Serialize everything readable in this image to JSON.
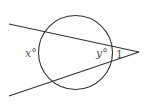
{
  "diagram": {
    "type": "geometry",
    "colors": {
      "stroke": "#333333",
      "label": "#555555",
      "background": "#ffffff"
    },
    "circle": {
      "cx": 75.5,
      "cy": 52.5,
      "r": 37
    },
    "vertex": {
      "x": 139,
      "y": 52
    },
    "lines": [
      {
        "name": "upper-secant",
        "x1": 9,
        "y1": 24,
        "x2": 139,
        "y2": 52
      },
      {
        "name": "lower-secant",
        "x1": 9,
        "y1": 96,
        "x2": 139,
        "y2": 52
      }
    ],
    "labels": {
      "far_arc": "x°",
      "near_arc": "y°",
      "angle": "1"
    }
  }
}
